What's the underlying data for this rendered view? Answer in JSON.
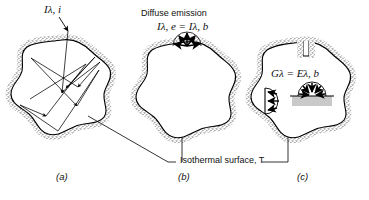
{
  "figure": {
    "type": "blackbody-cavity-diagram",
    "background": "#ffffff",
    "line_color": "#000000",
    "wall_fill": "#b9b9b9",
    "cavity_fill": "#ffffff",
    "sample_fill": "#c9c9c9"
  },
  "panels": [
    {
      "id": "a",
      "letter": "(a)",
      "caption": "Complete absorption after multiple internal reflections",
      "labels": [
        {
          "name": "incident-intensity-label",
          "symbol": "I",
          "subscript": "λ, i",
          "text": "Iλ, i"
        }
      ]
    },
    {
      "id": "b",
      "letter": "(b)",
      "caption": "Diffuse emission from aperture",
      "labels": [
        {
          "name": "diffuse-emission-title",
          "text": "Diffuse emission"
        },
        {
          "name": "diffuse-emission-equation",
          "lhs_symbol": "I",
          "lhs_subscript": "λ, e",
          "operator": "=",
          "rhs_symbol": "I",
          "rhs_subscript": "λ, b",
          "text": "Iλ, e = Iλ, b"
        }
      ]
    },
    {
      "id": "c",
      "letter": "(c)",
      "caption": "Irradiation of small object equals blackbody emissive power",
      "labels": [
        {
          "name": "irradiation-equation",
          "lhs_symbol": "G",
          "lhs_subscript": "λ",
          "operator": "=",
          "rhs_symbol": "E",
          "rhs_subscript": "λ, b",
          "text": "Gλ = Eλ, b"
        }
      ]
    }
  ],
  "annotations": {
    "isothermal_label": {
      "name": "isothermal-surface-label",
      "prefix": "Isothermal surface,",
      "symbol": "T",
      "text": "Isothermal surface, T"
    }
  },
  "panel_letters": {
    "a": "(a)",
    "b": "(b)",
    "c": "(c)"
  }
}
